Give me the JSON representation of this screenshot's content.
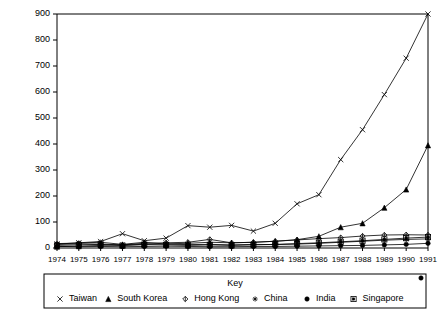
{
  "chart_data": {
    "type": "line",
    "title": "",
    "xlabel": "",
    "ylabel": "",
    "ylim": [
      0,
      900
    ],
    "ytick_step": 100,
    "grid": false,
    "legend_position": "bottom",
    "legend_title": "Key",
    "categories": [
      "1974",
      "1975",
      "1976",
      "1977",
      "1978",
      "1979",
      "1980",
      "1981",
      "1982",
      "1983",
      "1984",
      "1985",
      "1986",
      "1987",
      "1988",
      "1989",
      "1990",
      "1991"
    ],
    "yticks": [
      "0",
      "100",
      "200",
      "300",
      "400",
      "500",
      "600",
      "700",
      "800",
      "900"
    ],
    "series": [
      {
        "name": "Taiwan",
        "marker": "cross",
        "values": [
          15,
          20,
          25,
          55,
          28,
          38,
          86,
          80,
          87,
          65,
          95,
          170,
          205,
          340,
          455,
          590,
          730,
          900
        ]
      },
      {
        "name": "South Korea",
        "marker": "triangle",
        "values": [
          5,
          7,
          10,
          12,
          14,
          16,
          18,
          22,
          20,
          22,
          26,
          32,
          45,
          80,
          95,
          155,
          225,
          395
        ]
      },
      {
        "name": "Hong Kong",
        "marker": "diamond",
        "values": [
          14,
          16,
          15,
          12,
          18,
          20,
          22,
          33,
          20,
          22,
          26,
          31,
          36,
          40,
          46,
          50,
          51,
          50
        ]
      },
      {
        "name": "China",
        "marker": "star",
        "values": [
          17,
          19,
          22,
          14,
          22,
          15,
          13,
          14,
          12,
          14,
          13,
          15,
          18,
          22,
          26,
          30,
          33,
          35
        ]
      },
      {
        "name": "India",
        "marker": "circle",
        "values": [
          6,
          5,
          6,
          5,
          6,
          7,
          6,
          5,
          5,
          6,
          6,
          7,
          8,
          9,
          10,
          12,
          14,
          18
        ]
      },
      {
        "name": "Singapore",
        "marker": "square",
        "values": [
          10,
          12,
          14,
          9,
          13,
          12,
          10,
          12,
          10,
          12,
          14,
          17,
          20,
          24,
          28,
          33,
          38,
          42
        ]
      }
    ]
  }
}
